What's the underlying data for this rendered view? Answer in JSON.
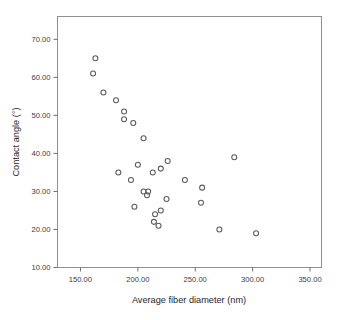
{
  "figure": {
    "background_color": "#ffffff",
    "frame_color": "#8f8f8f",
    "marker_color": "#5a5a5a",
    "text_color": "#262626"
  },
  "chart_data": {
    "type": "scatter",
    "title": "",
    "xlabel": "Average fiber diameter (nm)",
    "ylabel": "Contact angle (°)",
    "xlim": [
      130.0,
      360.0
    ],
    "ylim": [
      10.0,
      76.0
    ],
    "grid": false,
    "legend": null,
    "xticks": [
      150.0,
      200.0,
      250.0,
      300.0,
      350.0
    ],
    "xticklabels": [
      "150.00",
      "200.00",
      "250.00",
      "300.00",
      "350.00"
    ],
    "yticks": [
      10.0,
      20.0,
      30.0,
      40.0,
      50.0,
      60.0,
      70.0
    ],
    "yticklabels": [
      "10.00",
      "20.00",
      "30.00",
      "40.00",
      "50.00",
      "60.00",
      "70.00"
    ],
    "marker": "open-circle",
    "series": [
      {
        "name": "samples",
        "points": [
          [
            163.0,
            65.0
          ],
          [
            161.0,
            61.0
          ],
          [
            170.0,
            56.0
          ],
          [
            181.0,
            54.0
          ],
          [
            188.0,
            51.0
          ],
          [
            188.0,
            49.0
          ],
          [
            196.0,
            48.0
          ],
          [
            205.0,
            44.0
          ],
          [
            284.0,
            39.0
          ],
          [
            226.0,
            38.0
          ],
          [
            200.0,
            37.0
          ],
          [
            220.0,
            36.0
          ],
          [
            183.0,
            35.0
          ],
          [
            213.0,
            35.0
          ],
          [
            194.0,
            33.0
          ],
          [
            241.0,
            33.0
          ],
          [
            256.0,
            31.0
          ],
          [
            205.0,
            30.0
          ],
          [
            209.0,
            30.0
          ],
          [
            208.0,
            29.0
          ],
          [
            225.0,
            28.0
          ],
          [
            255.0,
            27.0
          ],
          [
            197.0,
            26.0
          ],
          [
            220.0,
            25.0
          ],
          [
            215.0,
            24.0
          ],
          [
            214.0,
            22.0
          ],
          [
            218.0,
            21.0
          ],
          [
            271.0,
            20.0
          ],
          [
            303.0,
            19.0
          ]
        ]
      }
    ]
  }
}
